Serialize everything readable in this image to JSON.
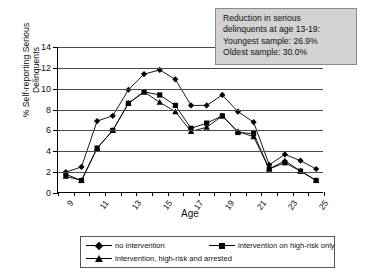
{
  "chart_data": {
    "type": "line",
    "title": "",
    "xlabel": "Age",
    "ylabel": "% Self-reporting Serious\nDelinquents",
    "xlim": [
      9,
      26
    ],
    "ylim": [
      0,
      14
    ],
    "yticks": [
      0,
      2,
      4,
      6,
      8,
      10,
      12,
      14
    ],
    "xticks": [
      9,
      10,
      11,
      12,
      13,
      14,
      15,
      16,
      17,
      18,
      19,
      20,
      21,
      22,
      23,
      24,
      25,
      26
    ],
    "xticklabels": [
      "9",
      "",
      "11",
      "",
      "13",
      "",
      "15",
      "",
      "17",
      "",
      "19",
      "",
      "21",
      "",
      "23",
      "",
      "25",
      ""
    ],
    "grid": true,
    "grid_axis": "y",
    "legend_position": "bottom",
    "x": [
      9.5,
      10.5,
      11.5,
      12.5,
      13.5,
      14.5,
      15.5,
      16.5,
      17.5,
      18.5,
      19.5,
      20.5,
      21.5,
      22.5,
      23.5,
      24.5,
      25.5
    ],
    "series": [
      {
        "name": "no intervention",
        "marker": "diamond",
        "values": [
          2.0,
          2.5,
          6.9,
          7.4,
          9.9,
          11.4,
          11.8,
          10.9,
          8.4,
          8.4,
          9.4,
          7.8,
          6.8,
          2.7,
          3.7,
          3.1,
          2.3
        ]
      },
      {
        "name": "intervention on high-risk only",
        "marker": "square",
        "values": [
          1.8,
          1.2,
          4.3,
          6.0,
          8.6,
          9.7,
          9.4,
          8.4,
          6.2,
          6.7,
          7.4,
          5.8,
          5.7,
          2.3,
          2.9,
          2.1,
          1.2
        ]
      },
      {
        "name": "intervention, high-risk and arrested",
        "marker": "triangle",
        "values": [
          1.6,
          1.2,
          4.3,
          6.0,
          8.6,
          9.7,
          8.7,
          7.8,
          5.9,
          6.3,
          7.4,
          5.9,
          5.4,
          2.3,
          3.1,
          2.1,
          1.2
        ]
      }
    ],
    "annotation": {
      "lines": [
        "Reduction in serious",
        "delinquents at age 13-19:",
        "Youngest sample: 26.9%",
        "Oldest sample: 30.0%"
      ]
    }
  },
  "legend": {
    "items": [
      {
        "label": "no intervention",
        "marker": "diamond"
      },
      {
        "label": "intervention on high-risk only",
        "marker": "square"
      },
      {
        "label": "intervention, high-risk and arrested",
        "marker": "triangle"
      }
    ]
  },
  "colors": {
    "series": "#000000",
    "grid": "#4a4a4a",
    "annotation_fill": "#d2d2d2",
    "annotation_border": "#8a8a8a",
    "background": "#ffffff"
  }
}
